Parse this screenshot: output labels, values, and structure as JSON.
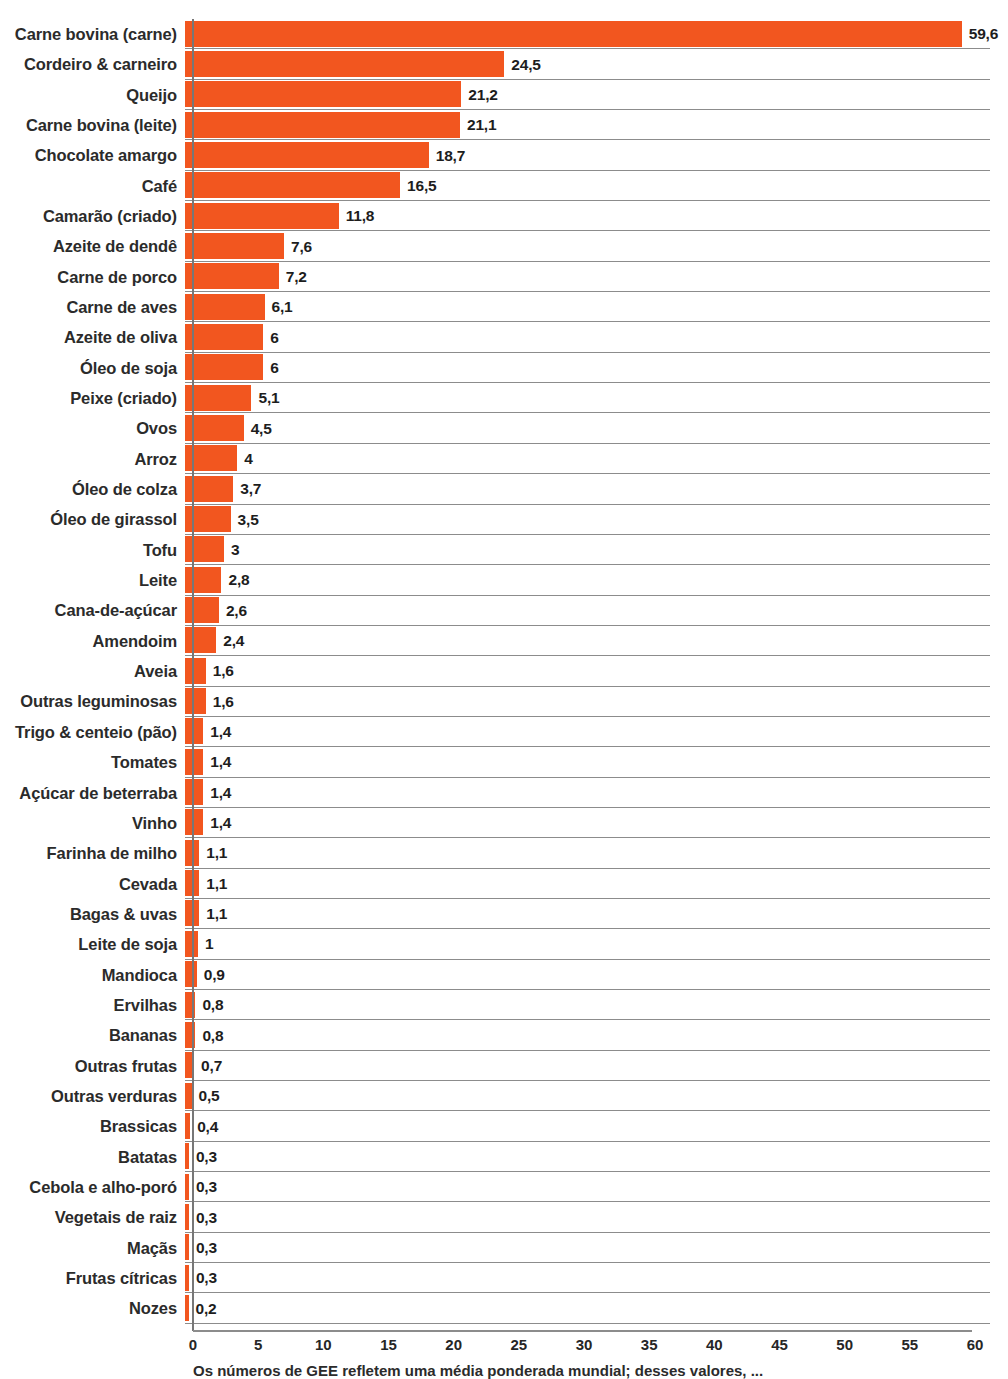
{
  "chart_data": {
    "type": "bar",
    "orientation": "horizontal",
    "title": "",
    "subtitle": "",
    "xlabel": "",
    "ylabel": "",
    "xlim": [
      0,
      60
    ],
    "xticks": [
      0,
      5,
      10,
      15,
      20,
      25,
      30,
      35,
      40,
      45,
      50,
      55,
      60
    ],
    "xtick_labels": [
      "0",
      "5",
      "10",
      "15",
      "20",
      "25",
      "30",
      "35",
      "40",
      "45",
      "50",
      "55",
      "60"
    ],
    "grid": "horizontal-row-rules",
    "legend": null,
    "bar_color": "#f2561f",
    "decimal_separator": ",",
    "categories": [
      "Carne bovina (carne)",
      "Cordeiro & carneiro",
      "Queijo",
      "Carne bovina (leite)",
      "Chocolate amargo",
      "Café",
      "Camarão (criado)",
      "Azeite de dendê",
      "Carne de porco",
      "Carne de aves",
      "Azeite de oliva",
      "Óleo de soja",
      "Peixe (criado)",
      "Ovos",
      "Arroz",
      "Óleo de colza",
      "Óleo de girassol",
      "Tofu",
      "Leite",
      "Cana-de-açúcar",
      "Amendoim",
      "Aveia",
      "Outras leguminosas",
      "Trigo & centeio (pão)",
      "Tomates",
      "Açúcar de beterraba",
      "Vinho",
      "Farinha de milho",
      "Cevada",
      "Bagas & uvas",
      "Leite de soja",
      "Mandioca",
      "Ervilhas",
      "Bananas",
      "Outras frutas",
      "Outras verduras",
      "Brassicas",
      "Batatas",
      "Cebola e alho-poró",
      "Vegetais de raiz",
      "Maçãs",
      "Frutas cítricas",
      "Nozes"
    ],
    "values": [
      59.6,
      24.5,
      21.2,
      21.1,
      18.7,
      16.5,
      11.8,
      7.6,
      7.2,
      6.1,
      6,
      6,
      5.1,
      4.5,
      4,
      3.7,
      3.5,
      3,
      2.8,
      2.6,
      2.4,
      1.6,
      1.6,
      1.4,
      1.4,
      1.4,
      1.4,
      1.1,
      1.1,
      1.1,
      1,
      0.9,
      0.8,
      0.8,
      0.7,
      0.5,
      0.4,
      0.3,
      0.3,
      0.3,
      0.3,
      0.3,
      0.2
    ],
    "value_labels": [
      "59,6",
      "24,5",
      "21,2",
      "21,1",
      "18,7",
      "16,5",
      "11,8",
      "7,6",
      "7,2",
      "6,1",
      "6",
      "6",
      "5,1",
      "4,5",
      "4",
      "3,7",
      "3,5",
      "3",
      "2,8",
      "2,6",
      "2,4",
      "1,6",
      "1,6",
      "1,4",
      "1,4",
      "1,4",
      "1,4",
      "1,1",
      "1,1",
      "1,1",
      "1",
      "0,9",
      "0,8",
      "0,8",
      "0,7",
      "0,5",
      "0,4",
      "0,3",
      "0,3",
      "0,3",
      "0,3",
      "0,3",
      "0,2"
    ]
  },
  "caption": "Os números de GEE refletem uma média ponderada mundial; desses valores, ..."
}
